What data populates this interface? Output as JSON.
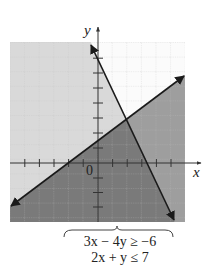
{
  "graph": {
    "x_axis_label": "x",
    "y_axis_label": "y",
    "origin_label": "0",
    "x_range": [
      -6,
      6
    ],
    "y_range": [
      -4,
      8
    ],
    "grid": true,
    "colors": {
      "background": "#ffffff",
      "light_region": "#dcdcdc",
      "medium_region": "#9a9a9a",
      "dark_region": "#777777",
      "line": "#1a1a1a",
      "grid": "#c8c8c8"
    },
    "lines": [
      {
        "equation": "3x - 4y = -6",
        "points": [
          [
            -6,
            -3
          ],
          [
            6,
            6
          ]
        ],
        "x_intercept": -2,
        "y_intercept": 1.5
      },
      {
        "equation": "2x + y = 7",
        "points": [
          [
            -0.5,
            8
          ],
          [
            5.5,
            -4
          ]
        ],
        "x_intercept": 3.5,
        "y_intercept": 7
      }
    ],
    "intersection": [
      2,
      3
    ]
  },
  "caption": {
    "inequality_1": "3x − 4y ≥ −6",
    "inequality_2": "2x + y ≤ 7"
  }
}
